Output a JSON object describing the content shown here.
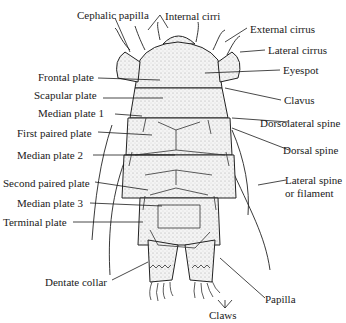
{
  "diagram": {
    "labels": [
      {
        "id": "cephalic_papilla",
        "text": "Cephalic papilla"
      },
      {
        "id": "internal_cirri",
        "text": "Internal cirri"
      },
      {
        "id": "external_cirrus",
        "text": "External cirrus"
      },
      {
        "id": "lateral_cirrus",
        "text": "Lateral cirrus"
      },
      {
        "id": "eyespot",
        "text": "Eyespot"
      },
      {
        "id": "frontal_plate",
        "text": "Frontal plate"
      },
      {
        "id": "scapular_plate",
        "text": "Scapular plate"
      },
      {
        "id": "clavus",
        "text": "Clavus"
      },
      {
        "id": "median_plate_1",
        "text": "Median plate 1"
      },
      {
        "id": "dorsolateral_spine",
        "text": "Dorsolateral spine"
      },
      {
        "id": "first_paired_plate",
        "text": "First paired plate"
      },
      {
        "id": "dorsal_spine",
        "text": "Dorsal spine"
      },
      {
        "id": "median_plate_2",
        "text": "Median plate 2"
      },
      {
        "id": "second_paired_plate",
        "text": "Second paired plate"
      },
      {
        "id": "lateral_spine_1",
        "text": "Lateral spine"
      },
      {
        "id": "lateral_spine_2",
        "text": "or filament"
      },
      {
        "id": "median_plate_3",
        "text": "Median plate 3"
      },
      {
        "id": "terminal_plate",
        "text": "Terminal plate"
      },
      {
        "id": "dentate_collar",
        "text": "Dentate collar"
      },
      {
        "id": "papilla",
        "text": "Papilla"
      },
      {
        "id": "claws",
        "text": "Claws"
      }
    ]
  }
}
